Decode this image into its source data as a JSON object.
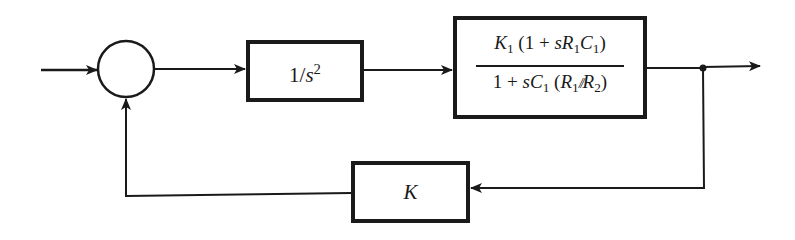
{
  "diagram": {
    "type": "block-diagram",
    "colors": {
      "stroke": "#1a1a1a",
      "background": "#ffffff"
    },
    "nodes": {
      "summing_junction": {
        "label": ""
      },
      "plant_integrator": {
        "label_parts": {
          "numerator": "1/",
          "var": "s",
          "exp": "2"
        },
        "label": "1/s^2"
      },
      "compensator": {
        "label": "K1 (1 + sR1C1) / (1 + sC1 (R1//R2))",
        "numerator": {
          "k": "K",
          "k_sub": "1",
          "open": " (1 + ",
          "s": "s",
          "r": "R",
          "r_sub": "1",
          "c": "C",
          "c_sub": "1",
          "close": ")"
        },
        "denominator": {
          "one_plus": "1 + ",
          "s": "s",
          "c": "C",
          "c_sub": "1",
          "open": " (",
          "r1": "R",
          "r1_sub": "1",
          "parallel": "//",
          "r2": "R",
          "r2_sub": "2",
          "close": ")"
        }
      },
      "feedback_gain": {
        "label": "K"
      }
    },
    "edges": [
      {
        "from": "input",
        "to": "summing_junction"
      },
      {
        "from": "summing_junction",
        "to": "plant_integrator"
      },
      {
        "from": "plant_integrator",
        "to": "compensator"
      },
      {
        "from": "compensator",
        "to": "branch_point"
      },
      {
        "from": "branch_point",
        "to": "output"
      },
      {
        "from": "branch_point",
        "to": "feedback_gain"
      },
      {
        "from": "feedback_gain",
        "to": "summing_junction"
      }
    ]
  }
}
